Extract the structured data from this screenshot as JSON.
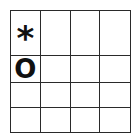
{
  "board": {
    "rows": 4,
    "cols": 4,
    "cells": [
      [
        "*",
        "",
        "",
        ""
      ],
      [
        "O",
        "",
        "",
        ""
      ],
      [
        "",
        "",
        "",
        ""
      ],
      [
        "",
        "",
        "",
        ""
      ]
    ]
  }
}
